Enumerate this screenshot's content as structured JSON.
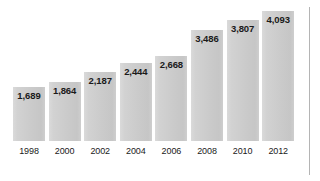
{
  "chart_data": {
    "type": "bar",
    "title": "",
    "subtitle": "",
    "xlabel": "",
    "ylabel": "",
    "categories": [
      "1998",
      "2000",
      "2002",
      "2004",
      "2006",
      "2008",
      "2010",
      "2012"
    ],
    "values": [
      1689,
      1864,
      2187,
      2444,
      2668,
      3486,
      3807,
      4093
    ],
    "value_labels": [
      "1,689",
      "1,864",
      "2,187",
      "2,444",
      "2,668",
      "3,486",
      "3,807",
      "4,093"
    ],
    "ylim": [
      0,
      4093
    ],
    "grid": false,
    "legend": false,
    "legend_position": "none",
    "series": [
      {
        "name": "",
        "values": [
          1689,
          1864,
          2187,
          2444,
          2668,
          3486,
          3807,
          4093
        ]
      }
    ],
    "annotations": []
  },
  "style": {
    "bar_color": "#cfcfcf",
    "bar_edge_color": "#c2c2c2",
    "value_label_color": "#1a1a1a",
    "tick_label_color": "#1a1a1a",
    "background_color": "#ffffff",
    "rule_color": "#b4b4b4"
  }
}
